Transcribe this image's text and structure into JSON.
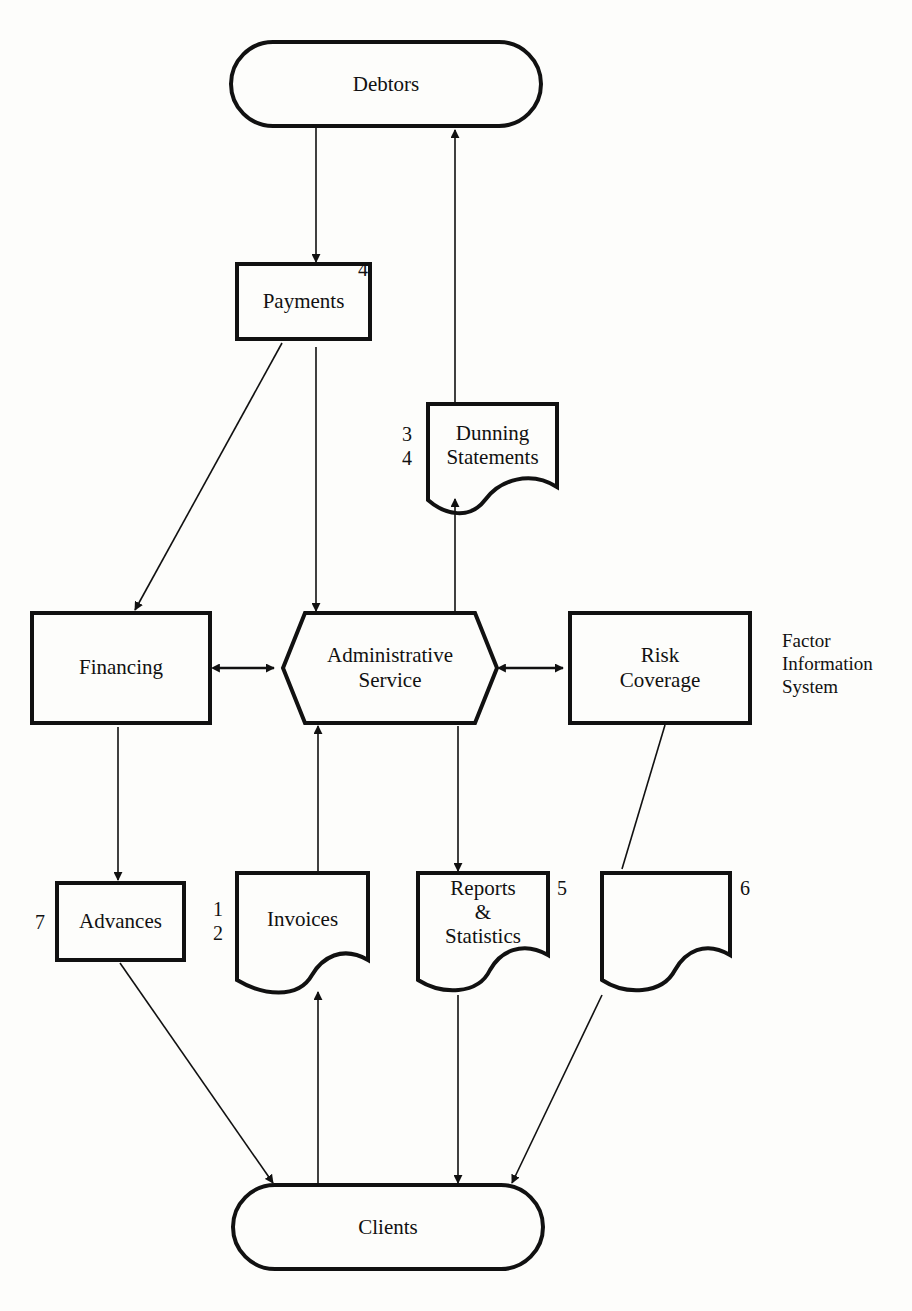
{
  "diagram": {
    "type": "data-flow",
    "side_label": [
      "Factor",
      "Information",
      "System"
    ],
    "nodes": {
      "debtors": {
        "label": "Debtors",
        "shape": "terminator"
      },
      "payments": {
        "label": "Payments",
        "shape": "process",
        "number": "4"
      },
      "dunning": {
        "label_line1": "Dunning",
        "label_line2": "Statements",
        "shape": "document",
        "numbers": [
          "3",
          "4"
        ]
      },
      "financing": {
        "label": "Financing",
        "shape": "process"
      },
      "admin": {
        "label_line1": "Administrative",
        "label_line2": "Service",
        "shape": "hexagon"
      },
      "risk": {
        "label_line1": "Risk",
        "label_line2": "Coverage",
        "shape": "process"
      },
      "advances": {
        "label": "Advances",
        "shape": "process",
        "number": "7"
      },
      "invoices": {
        "label": "Invoices",
        "shape": "document",
        "numbers": [
          "1",
          "2"
        ]
      },
      "reports": {
        "label_line1": "Reports",
        "label_line2": "&",
        "label_line3": "Statistics",
        "shape": "document",
        "number": "5"
      },
      "blank_doc": {
        "label": "",
        "shape": "document",
        "number": "6"
      },
      "clients": {
        "label": "Clients",
        "shape": "terminator"
      }
    },
    "edges": [
      {
        "from": "debtors",
        "to": "payments"
      },
      {
        "from": "dunning",
        "to": "debtors"
      },
      {
        "from": "payments",
        "to": "financing"
      },
      {
        "from": "payments",
        "to": "admin"
      },
      {
        "from": "admin",
        "to": "dunning"
      },
      {
        "from": "financing",
        "to": "admin",
        "bidirectional": true
      },
      {
        "from": "admin",
        "to": "risk",
        "bidirectional": true
      },
      {
        "from": "financing",
        "to": "advances"
      },
      {
        "from": "invoices",
        "to": "admin"
      },
      {
        "from": "admin",
        "to": "reports"
      },
      {
        "from": "risk",
        "to": "blank_doc",
        "arrow": false
      },
      {
        "from": "advances",
        "to": "clients"
      },
      {
        "from": "clients",
        "to": "invoices"
      },
      {
        "from": "reports",
        "to": "clients"
      },
      {
        "from": "blank_doc",
        "to": "clients"
      }
    ]
  }
}
